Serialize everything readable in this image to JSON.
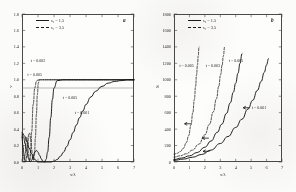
{
  "figure": {
    "background": "#fbfbfa",
    "ink": "#1a1a1a",
    "panel_tag_a": "a",
    "panel_tag_b": "b"
  },
  "legend": {
    "entry1_label": "s₂ = 1.5",
    "entry2_label": "s₁ = 3.5",
    "entry1_style": "solid",
    "entry2_style": "dashed"
  },
  "chart_data": [
    {
      "type": "line",
      "panel": "a",
      "title": "",
      "xlabel": "x/λ",
      "ylabel": "v",
      "xlim": [
        0,
        7
      ],
      "ylim": [
        0,
        1.8
      ],
      "xticks": [
        0,
        1,
        2,
        3,
        4,
        5,
        6,
        7
      ],
      "xtick_labels": [
        "0",
        "1",
        "2",
        "3",
        "4",
        "5",
        "6",
        "7"
      ],
      "yticks": [
        0.0,
        0.2,
        0.4,
        0.6,
        0.8,
        1.0,
        1.2,
        1.4,
        1.6,
        1.8
      ],
      "ytick_labels": [
        "0.0",
        "0.2",
        "0.4",
        "0.6",
        "0.8",
        "1.0",
        "1.2",
        "1.4",
        "1.6",
        "1.8"
      ],
      "grid": false,
      "legend_position": "upper-left",
      "annotations": [
        {
          "text": "t = 0.002",
          "x": 0.55,
          "y": 1.23
        },
        {
          "text": "t = 0.005",
          "x": 0.35,
          "y": 1.06
        },
        {
          "text": "t = 0.005",
          "x": 2.55,
          "y": 0.78
        },
        {
          "text": "t = 0.001",
          "x": 3.3,
          "y": 0.6
        }
      ],
      "reference_line": {
        "y": 0.9,
        "style": "thin-solid"
      },
      "series": [
        {
          "name": "t = 0.002",
          "style": "dashed",
          "x": [
            0.0,
            0.06,
            0.12,
            0.18,
            0.24,
            0.3,
            0.36,
            0.42,
            0.48,
            0.54,
            0.6,
            0.66,
            0.72,
            0.78,
            0.84,
            0.9,
            0.96,
            1.02,
            1.08,
            1.2,
            1.4,
            1.8,
            2.4,
            3.2,
            4.2,
            5.4,
            6.6,
            7.0
          ],
          "y": [
            0.3,
            0.2,
            0.1,
            0.03,
            0.0,
            0.08,
            0.22,
            0.34,
            0.35,
            0.28,
            0.16,
            0.06,
            0.02,
            0.1,
            0.3,
            0.58,
            0.82,
            0.96,
            1.0,
            1.0,
            1.0,
            1.0,
            1.0,
            1.0,
            1.0,
            1.0,
            1.0,
            1.0
          ]
        },
        {
          "name": "t = 0.005",
          "style": "dashed",
          "x": [
            0.0,
            0.05,
            0.1,
            0.15,
            0.2,
            0.25,
            0.3,
            0.35,
            0.4,
            0.45,
            0.5,
            0.55,
            0.6,
            0.7,
            0.8,
            0.9,
            1.0,
            1.2,
            1.6,
            2.2,
            3.0,
            4.0,
            5.2,
            6.4,
            7.0
          ],
          "y": [
            0.32,
            0.18,
            0.06,
            0.0,
            0.1,
            0.24,
            0.3,
            0.24,
            0.12,
            0.03,
            0.02,
            0.14,
            0.36,
            0.7,
            0.9,
            0.98,
            1.0,
            1.0,
            1.0,
            1.0,
            1.0,
            1.0,
            1.0,
            1.0,
            1.0
          ]
        },
        {
          "name": "t = 0.005 (solid)",
          "style": "solid",
          "x": [
            0.0,
            0.1,
            0.2,
            0.3,
            0.4,
            0.5,
            0.6,
            0.7,
            0.8,
            0.9,
            1.0,
            1.1,
            1.2,
            1.3,
            1.4,
            1.5,
            1.6,
            1.7,
            1.8,
            1.9,
            2.0,
            2.2,
            2.6,
            3.2,
            4.0,
            5.0,
            6.0,
            7.0
          ],
          "y": [
            0.34,
            0.3,
            0.22,
            0.13,
            0.05,
            0.0,
            0.02,
            0.07,
            0.12,
            0.14,
            0.12,
            0.08,
            0.04,
            0.01,
            0.0,
            0.03,
            0.12,
            0.3,
            0.54,
            0.76,
            0.9,
            0.99,
            1.0,
            1.0,
            1.0,
            1.0,
            1.0,
            1.0
          ]
        },
        {
          "name": "t = 0.001",
          "style": "solid",
          "x": [
            0.0,
            0.15,
            0.3,
            0.45,
            0.6,
            0.8,
            1.0,
            1.2,
            1.4,
            1.6,
            1.8,
            2.0,
            2.2,
            2.4,
            2.6,
            2.8,
            3.0,
            3.2,
            3.4,
            3.6,
            3.8,
            4.0,
            4.3,
            4.6,
            5.0,
            5.4,
            5.8,
            6.2,
            6.6,
            7.0
          ],
          "y": [
            0.36,
            0.32,
            0.25,
            0.17,
            0.1,
            0.03,
            0.0,
            0.0,
            0.0,
            0.0,
            0.0,
            0.01,
            0.03,
            0.07,
            0.12,
            0.19,
            0.27,
            0.36,
            0.45,
            0.54,
            0.62,
            0.7,
            0.79,
            0.86,
            0.92,
            0.96,
            0.98,
            0.99,
            1.0,
            1.0
          ]
        }
      ]
    },
    {
      "type": "line",
      "panel": "b",
      "title": "",
      "xlabel": "x/λ",
      "ylabel": "S",
      "xlim": [
        0,
        7
      ],
      "ylim": [
        0,
        1800
      ],
      "xticks": [
        0,
        1,
        2,
        3,
        4,
        5,
        6,
        7
      ],
      "xtick_labels": [
        "0",
        "1",
        "2",
        "3",
        "4",
        "5",
        "6",
        "7"
      ],
      "yticks": [
        0,
        200,
        400,
        600,
        800,
        1000,
        1200,
        1400,
        1600,
        1800
      ],
      "ytick_labels": [
        "0",
        "200",
        "400",
        "600",
        "800",
        "1000",
        "1200",
        "1400",
        "1600",
        "1800"
      ],
      "grid": false,
      "legend_position": "upper-left",
      "annotations": [
        {
          "text": "t = 0.005",
          "x": 0.35,
          "y": 1175
        },
        {
          "text": "t = 0.003",
          "x": 2.05,
          "y": 1175
        },
        {
          "text": "t = 0.005",
          "x": 3.55,
          "y": 1230
        },
        {
          "text": "t = 0.001",
          "x": 5.05,
          "y": 660
        }
      ],
      "arrows": [
        {
          "x": 0.75,
          "y": 465,
          "dir": "left"
        },
        {
          "x": 1.9,
          "y": 290,
          "dir": "left"
        },
        {
          "x": 1.95,
          "y": 130,
          "dir": "left"
        },
        {
          "x": 4.55,
          "y": 660,
          "dir": "left"
        }
      ],
      "series": [
        {
          "name": "t = 0.005",
          "style": "dashed",
          "x": [
            0.0,
            0.2,
            0.4,
            0.6,
            0.8,
            0.95,
            1.1,
            1.22,
            1.32,
            1.4,
            1.46,
            1.52,
            1.57,
            1.62
          ],
          "y": [
            95,
            105,
            125,
            165,
            235,
            320,
            450,
            600,
            760,
            920,
            1060,
            1180,
            1290,
            1400
          ]
        },
        {
          "name": "t = 0.003",
          "style": "dashed",
          "x": [
            0.0,
            0.4,
            0.8,
            1.2,
            1.6,
            2.0,
            2.3,
            2.55,
            2.75,
            2.9,
            3.02,
            3.12,
            3.2,
            3.28
          ],
          "y": [
            60,
            75,
            100,
            145,
            215,
            330,
            460,
            610,
            770,
            920,
            1060,
            1180,
            1290,
            1400
          ]
        },
        {
          "name": "t = 0.005 (solid)",
          "style": "solid",
          "x": [
            0.0,
            0.5,
            1.0,
            1.5,
            2.0,
            2.4,
            2.8,
            3.1,
            3.4,
            3.65,
            3.85,
            4.0,
            4.15,
            4.28,
            4.4
          ],
          "y": [
            30,
            48,
            75,
            115,
            180,
            255,
            360,
            460,
            590,
            720,
            850,
            960,
            1080,
            1200,
            1320
          ]
        },
        {
          "name": "t = 0.001",
          "style": "solid",
          "x": [
            0.0,
            0.6,
            1.2,
            1.8,
            2.4,
            3.0,
            3.5,
            4.0,
            4.4,
            4.8,
            5.1,
            5.4,
            5.65,
            5.85,
            6.0,
            6.12
          ],
          "y": [
            20,
            35,
            58,
            92,
            145,
            225,
            310,
            420,
            520,
            645,
            750,
            870,
            980,
            1090,
            1180,
            1260
          ]
        }
      ]
    }
  ]
}
